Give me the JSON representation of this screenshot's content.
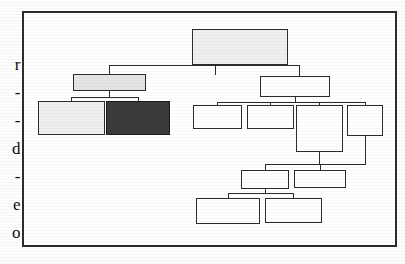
{
  "page": {
    "kind": "scanned-document-figure",
    "width": 405,
    "height": 264,
    "background_color": "#fdfdfd"
  },
  "margin_text": {
    "description": "Cut-off characters from adjacent text column at the left page edge",
    "characters": [
      {
        "char": "r",
        "top": 56
      },
      {
        "char": "-",
        "top": 84
      },
      {
        "char": "-",
        "top": 112
      },
      {
        "char": "d",
        "top": 140
      },
      {
        "char": "-",
        "top": 168
      },
      {
        "char": "e",
        "top": 196
      },
      {
        "char": "o",
        "top": 224
      }
    ]
  },
  "figure": {
    "frame": {
      "border_color": "#2c2c2c",
      "border_width": 2,
      "left": 22,
      "top": 11,
      "width": 375,
      "height": 236
    },
    "colors": {
      "line": "#2b2b2b",
      "node_fill_default": "#ffffff",
      "node_fill_light": "#efefef",
      "node_fill_gray": "#e4e4e4",
      "node_fill_dark": "#3b3b3b"
    },
    "nodes": [
      {
        "id": "root",
        "label": "",
        "fill": "fill-light",
        "left": 168,
        "top": 16,
        "width": 96,
        "height": 36
      },
      {
        "id": "left-branch",
        "label": "",
        "fill": "fill-gray",
        "left": 49,
        "top": 61,
        "width": 73,
        "height": 17
      },
      {
        "id": "left-child-1",
        "label": "",
        "fill": "fill-light",
        "left": 14,
        "top": 88,
        "width": 67,
        "height": 34
      },
      {
        "id": "left-child-2",
        "label": "",
        "fill": "fill-dark",
        "left": 82,
        "top": 88,
        "width": 64,
        "height": 34
      },
      {
        "id": "right-branch",
        "label": "",
        "fill": "",
        "left": 236,
        "top": 63,
        "width": 70,
        "height": 21
      },
      {
        "id": "right-child-1",
        "label": "",
        "fill": "",
        "left": 169,
        "top": 92,
        "width": 49,
        "height": 24
      },
      {
        "id": "right-child-2",
        "label": "",
        "fill": "",
        "left": 223,
        "top": 92,
        "width": 47,
        "height": 24
      },
      {
        "id": "right-child-3",
        "label": "",
        "fill": "",
        "left": 272,
        "top": 92,
        "width": 47,
        "height": 47
      },
      {
        "id": "right-child-4",
        "label": "",
        "fill": "",
        "left": 323,
        "top": 92,
        "width": 36,
        "height": 31
      },
      {
        "id": "mid-left",
        "label": "",
        "fill": "",
        "left": 217,
        "top": 157,
        "width": 48,
        "height": 19
      },
      {
        "id": "mid-right",
        "label": "",
        "fill": "",
        "left": 270,
        "top": 157,
        "width": 52,
        "height": 18
      },
      {
        "id": "bottom-left",
        "label": "",
        "fill": "",
        "left": 172,
        "top": 185,
        "width": 64,
        "height": 26
      },
      {
        "id": "bottom-right",
        "label": "",
        "fill": "",
        "left": 241,
        "top": 185,
        "width": 57,
        "height": 25
      }
    ],
    "edges": [
      {
        "id": "root-down-left",
        "orient": "v",
        "left": 191,
        "top": 52,
        "length": 10
      },
      {
        "id": "root-bus",
        "orient": "h",
        "left": 85,
        "top": 52,
        "length": 191
      },
      {
        "id": "root-down-right",
        "orient": "v",
        "left": 275,
        "top": 52,
        "length": 11
      },
      {
        "id": "left-branch-stem",
        "orient": "v",
        "left": 85,
        "top": 52,
        "length": 9
      },
      {
        "id": "left-branch-down",
        "orient": "v",
        "left": 85,
        "top": 78,
        "length": 6
      },
      {
        "id": "left-branch-bus",
        "orient": "h",
        "left": 47,
        "top": 84,
        "length": 68
      },
      {
        "id": "left-c1-down",
        "orient": "v",
        "left": 47,
        "top": 84,
        "length": 4
      },
      {
        "id": "left-c2-down",
        "orient": "v",
        "left": 114,
        "top": 84,
        "length": 4
      },
      {
        "id": "right-branch-down",
        "orient": "v",
        "left": 271,
        "top": 84,
        "length": 5
      },
      {
        "id": "right-bus",
        "orient": "h",
        "left": 193,
        "top": 89,
        "length": 148
      },
      {
        "id": "right-c1-down",
        "orient": "v",
        "left": 193,
        "top": 89,
        "length": 3
      },
      {
        "id": "right-c2-down",
        "orient": "v",
        "left": 246,
        "top": 89,
        "length": 3
      },
      {
        "id": "right-c3-down",
        "orient": "v",
        "left": 295,
        "top": 89,
        "length": 3
      },
      {
        "id": "right-c4-down",
        "orient": "v",
        "left": 341,
        "top": 89,
        "length": 3
      },
      {
        "id": "c4-tail-down",
        "orient": "v",
        "left": 341,
        "top": 123,
        "length": 28
      },
      {
        "id": "c3-tail-down",
        "orient": "v",
        "left": 295,
        "top": 139,
        "length": 12
      },
      {
        "id": "lower-bus",
        "orient": "h",
        "left": 241,
        "top": 151,
        "length": 101
      },
      {
        "id": "lower-bus-stem",
        "orient": "v",
        "left": 241,
        "top": 151,
        "length": 6
      },
      {
        "id": "mid-left-down",
        "orient": "v",
        "left": 241,
        "top": 151,
        "length": 6
      },
      {
        "id": "mid-right-down",
        "orient": "v",
        "left": 296,
        "top": 151,
        "length": 6
      },
      {
        "id": "mid-left-tail",
        "orient": "v",
        "left": 241,
        "top": 176,
        "length": 4
      },
      {
        "id": "bottom-bus",
        "orient": "h",
        "left": 204,
        "top": 180,
        "length": 66
      },
      {
        "id": "bottom-left-down",
        "orient": "v",
        "left": 204,
        "top": 180,
        "length": 5
      },
      {
        "id": "bottom-right-down",
        "orient": "v",
        "left": 269,
        "top": 180,
        "length": 5
      }
    ]
  }
}
